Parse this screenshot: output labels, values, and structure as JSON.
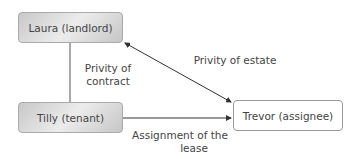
{
  "nodes": {
    "landlord": "Laura (landlord)",
    "tenant": "Tilly (tenant)",
    "assignee": "Trevor (assignee)"
  },
  "edges": {
    "contract": {
      "line1": "Privity of",
      "line2": "contract"
    },
    "estate": "Privity of estate",
    "assignment": {
      "line1": "Assignment of the",
      "line2": "lease"
    }
  }
}
